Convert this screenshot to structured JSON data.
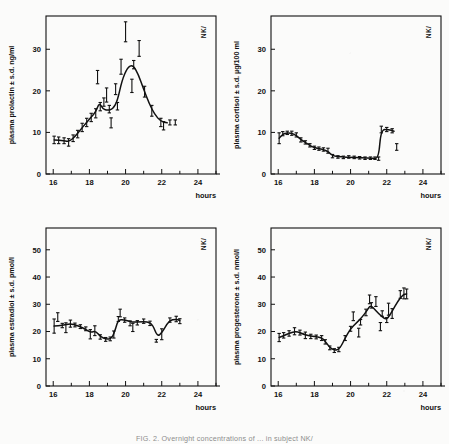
{
  "figure": {
    "subject_label": "NK/",
    "caption": "FIG. 2. Overnight concentrations of ... in subject NK/",
    "xlabel": "hours",
    "x_ticks_major": [
      "16",
      "18",
      "20",
      "22",
      "24"
    ],
    "x_range": [
      15.6,
      25.0
    ],
    "ink_color": "#111111"
  },
  "chart_data": [
    {
      "id": "prolactin",
      "type": "line",
      "title": "",
      "ylabel": "plasma prolactin ± s.d. ng/ml",
      "xlabel": "hours",
      "subject": "NK/",
      "ylim": [
        0,
        38
      ],
      "y_ticks": [
        "0",
        "10",
        "20",
        "30"
      ],
      "xlim": [
        15.6,
        25.0
      ],
      "x_ticks": [
        "16",
        "18",
        "20",
        "22",
        "24"
      ],
      "grid": false,
      "legend": "none",
      "points": [
        {
          "x": 16.05,
          "y": 8.2,
          "sd": 0.9
        },
        {
          "x": 16.3,
          "y": 8.1,
          "sd": 0.8
        },
        {
          "x": 16.6,
          "y": 8.0,
          "sd": 0.7
        },
        {
          "x": 16.85,
          "y": 7.6,
          "sd": 0.9
        },
        {
          "x": 17.1,
          "y": 8.6,
          "sd": 0.8
        },
        {
          "x": 17.35,
          "y": 9.6,
          "sd": 0.9
        },
        {
          "x": 17.6,
          "y": 11.2,
          "sd": 1.0
        },
        {
          "x": 17.85,
          "y": 12.4,
          "sd": 1.0
        },
        {
          "x": 18.1,
          "y": 13.6,
          "sd": 1.0
        },
        {
          "x": 18.35,
          "y": 14.6,
          "sd": 1.1
        },
        {
          "x": 18.45,
          "y": 23.3,
          "sd": 1.6
        },
        {
          "x": 18.6,
          "y": 16.2,
          "sd": 1.0
        },
        {
          "x": 18.8,
          "y": 17.3,
          "sd": 1.0
        },
        {
          "x": 18.95,
          "y": 19.0,
          "sd": 1.7
        },
        {
          "x": 19.1,
          "y": 15.6,
          "sd": 0.9
        },
        {
          "x": 19.2,
          "y": 12.3,
          "sd": 1.2
        },
        {
          "x": 19.45,
          "y": 20.4,
          "sd": 1.3
        },
        {
          "x": 19.55,
          "y": 16.3,
          "sd": 0.9
        },
        {
          "x": 19.75,
          "y": 25.8,
          "sd": 1.8
        },
        {
          "x": 20.0,
          "y": 34.2,
          "sd": 2.4
        },
        {
          "x": 20.35,
          "y": 21.2,
          "sd": 1.6
        },
        {
          "x": 20.45,
          "y": 26.3,
          "sd": 1.0
        },
        {
          "x": 20.75,
          "y": 30.2,
          "sd": 1.9
        },
        {
          "x": 21.05,
          "y": 19.8,
          "sd": 1.3
        },
        {
          "x": 21.45,
          "y": 15.2,
          "sd": 1.3
        },
        {
          "x": 21.95,
          "y": 12.4,
          "sd": 1.0
        },
        {
          "x": 22.1,
          "y": 11.6,
          "sd": 1.0
        },
        {
          "x": 22.45,
          "y": 12.4,
          "sd": 0.6
        },
        {
          "x": 22.75,
          "y": 12.4,
          "sd": 0.6
        }
      ],
      "curve": [
        {
          "x": 16.05,
          "y": 8.2
        },
        {
          "x": 16.6,
          "y": 8.0
        },
        {
          "x": 16.9,
          "y": 7.8
        },
        {
          "x": 17.2,
          "y": 9.0
        },
        {
          "x": 17.5,
          "y": 10.6
        },
        {
          "x": 17.8,
          "y": 12.2
        },
        {
          "x": 18.1,
          "y": 13.7
        },
        {
          "x": 18.35,
          "y": 14.9
        },
        {
          "x": 18.55,
          "y": 17.2
        },
        {
          "x": 18.75,
          "y": 15.6
        },
        {
          "x": 19.0,
          "y": 15.3
        },
        {
          "x": 19.3,
          "y": 15.6
        },
        {
          "x": 19.55,
          "y": 17.6
        },
        {
          "x": 19.8,
          "y": 22.5
        },
        {
          "x": 20.1,
          "y": 25.6
        },
        {
          "x": 20.4,
          "y": 26.3
        },
        {
          "x": 20.7,
          "y": 24.0
        },
        {
          "x": 21.0,
          "y": 20.4
        },
        {
          "x": 21.3,
          "y": 17.0
        },
        {
          "x": 21.6,
          "y": 14.4
        },
        {
          "x": 21.95,
          "y": 12.6
        },
        {
          "x": 22.3,
          "y": 12.3
        }
      ]
    },
    {
      "id": "cortisol",
      "type": "line",
      "title": "",
      "ylabel": "plasma cortisol ± s.d. µg/100 ml",
      "xlabel": "hours",
      "subject": "NK/",
      "ylim": [
        0,
        38
      ],
      "y_ticks": [
        "0",
        "10",
        "20",
        "30"
      ],
      "xlim": [
        15.6,
        25.0
      ],
      "x_ticks": [
        "16",
        "18",
        "20",
        "22",
        "24"
      ],
      "grid": false,
      "legend": "none",
      "points": [
        {
          "x": 16.05,
          "y": 8.6,
          "sd": 1.3
        },
        {
          "x": 16.25,
          "y": 9.7,
          "sd": 0.5
        },
        {
          "x": 16.5,
          "y": 9.9,
          "sd": 0.4
        },
        {
          "x": 16.75,
          "y": 9.8,
          "sd": 0.5
        },
        {
          "x": 17.0,
          "y": 9.4,
          "sd": 0.5
        },
        {
          "x": 17.25,
          "y": 8.2,
          "sd": 0.5
        },
        {
          "x": 17.5,
          "y": 7.6,
          "sd": 0.4
        },
        {
          "x": 17.75,
          "y": 6.9,
          "sd": 0.4
        },
        {
          "x": 18.0,
          "y": 6.3,
          "sd": 0.4
        },
        {
          "x": 18.25,
          "y": 6.1,
          "sd": 0.4
        },
        {
          "x": 18.5,
          "y": 5.9,
          "sd": 0.4
        },
        {
          "x": 18.75,
          "y": 5.6,
          "sd": 0.6
        },
        {
          "x": 19.0,
          "y": 4.3,
          "sd": 0.4
        },
        {
          "x": 19.3,
          "y": 4.1,
          "sd": 0.3
        },
        {
          "x": 19.6,
          "y": 4.0,
          "sd": 0.3
        },
        {
          "x": 19.9,
          "y": 4.1,
          "sd": 0.3
        },
        {
          "x": 20.2,
          "y": 4.0,
          "sd": 0.3
        },
        {
          "x": 20.5,
          "y": 3.9,
          "sd": 0.3
        },
        {
          "x": 20.8,
          "y": 3.8,
          "sd": 0.3
        },
        {
          "x": 21.1,
          "y": 3.8,
          "sd": 0.3
        },
        {
          "x": 21.35,
          "y": 3.8,
          "sd": 0.3
        },
        {
          "x": 21.55,
          "y": 3.7,
          "sd": 0.4
        },
        {
          "x": 21.7,
          "y": 10.7,
          "sd": 0.8
        },
        {
          "x": 22.0,
          "y": 10.7,
          "sd": 0.5
        },
        {
          "x": 22.3,
          "y": 10.4,
          "sd": 0.5
        },
        {
          "x": 22.55,
          "y": 6.5,
          "sd": 0.8
        }
      ],
      "curve": [
        {
          "x": 16.05,
          "y": 8.6
        },
        {
          "x": 16.3,
          "y": 9.8
        },
        {
          "x": 16.7,
          "y": 9.9
        },
        {
          "x": 17.0,
          "y": 9.3
        },
        {
          "x": 17.3,
          "y": 8.1
        },
        {
          "x": 17.6,
          "y": 7.3
        },
        {
          "x": 17.9,
          "y": 6.5
        },
        {
          "x": 18.2,
          "y": 6.1
        },
        {
          "x": 18.5,
          "y": 5.9
        },
        {
          "x": 18.8,
          "y": 5.3
        },
        {
          "x": 19.0,
          "y": 4.3
        },
        {
          "x": 19.5,
          "y": 4.1
        },
        {
          "x": 20.0,
          "y": 4.0
        },
        {
          "x": 20.6,
          "y": 3.9
        },
        {
          "x": 21.2,
          "y": 3.8
        },
        {
          "x": 21.55,
          "y": 3.7
        },
        {
          "x": 21.68,
          "y": 10.7
        },
        {
          "x": 22.1,
          "y": 10.7
        },
        {
          "x": 22.4,
          "y": 10.3
        }
      ]
    },
    {
      "id": "estradiol",
      "type": "line",
      "title": "",
      "ylabel": "plasma estradiol ± s.d. pmol/l",
      "xlabel": "hours",
      "subject": "NK/",
      "ylim": [
        0,
        58
      ],
      "y_ticks": [
        "0",
        "10",
        "20",
        "30",
        "40",
        "50"
      ],
      "xlim": [
        15.6,
        25.0
      ],
      "x_ticks": [
        "16",
        "18",
        "20",
        "22",
        "24"
      ],
      "grid": false,
      "legend": "none",
      "points": [
        {
          "x": 16.05,
          "y": 22.0,
          "sd": 2.6
        },
        {
          "x": 16.25,
          "y": 25.3,
          "sd": 1.6
        },
        {
          "x": 16.5,
          "y": 22.2,
          "sd": 0.8
        },
        {
          "x": 16.7,
          "y": 21.4,
          "sd": 1.8
        },
        {
          "x": 16.95,
          "y": 22.9,
          "sd": 1.3
        },
        {
          "x": 17.2,
          "y": 22.4,
          "sd": 0.7
        },
        {
          "x": 17.5,
          "y": 21.8,
          "sd": 0.7
        },
        {
          "x": 17.8,
          "y": 21.0,
          "sd": 0.7
        },
        {
          "x": 18.05,
          "y": 19.0,
          "sd": 1.7
        },
        {
          "x": 18.3,
          "y": 20.3,
          "sd": 1.8
        },
        {
          "x": 18.6,
          "y": 18.0,
          "sd": 0.8
        },
        {
          "x": 18.9,
          "y": 17.1,
          "sd": 0.7
        },
        {
          "x": 19.15,
          "y": 17.3,
          "sd": 0.7
        },
        {
          "x": 19.35,
          "y": 18.9,
          "sd": 1.3
        },
        {
          "x": 19.6,
          "y": 24.6,
          "sd": 0.9
        },
        {
          "x": 19.7,
          "y": 26.8,
          "sd": 1.4
        },
        {
          "x": 19.95,
          "y": 24.2,
          "sd": 0.8
        },
        {
          "x": 20.25,
          "y": 23.0,
          "sd": 0.9
        },
        {
          "x": 20.4,
          "y": 21.5,
          "sd": 1.5
        },
        {
          "x": 20.65,
          "y": 23.2,
          "sd": 0.8
        },
        {
          "x": 21.0,
          "y": 23.8,
          "sd": 0.8
        },
        {
          "x": 21.35,
          "y": 23.0,
          "sd": 0.8
        },
        {
          "x": 21.7,
          "y": 16.6,
          "sd": 0.5
        },
        {
          "x": 22.0,
          "y": 19.0,
          "sd": 2.0
        },
        {
          "x": 22.45,
          "y": 24.2,
          "sd": 0.8
        },
        {
          "x": 22.8,
          "y": 24.6,
          "sd": 1.0
        },
        {
          "x": 23.0,
          "y": 23.8,
          "sd": 0.9
        }
      ],
      "curve": [
        {
          "x": 16.05,
          "y": 22.0
        },
        {
          "x": 16.5,
          "y": 22.3
        },
        {
          "x": 16.95,
          "y": 22.9
        },
        {
          "x": 17.3,
          "y": 22.3
        },
        {
          "x": 17.7,
          "y": 21.2
        },
        {
          "x": 18.05,
          "y": 19.6
        },
        {
          "x": 18.35,
          "y": 20.2
        },
        {
          "x": 18.6,
          "y": 18.1
        },
        {
          "x": 18.95,
          "y": 17.1
        },
        {
          "x": 19.25,
          "y": 17.5
        },
        {
          "x": 19.45,
          "y": 21.0
        },
        {
          "x": 19.6,
          "y": 24.5
        },
        {
          "x": 20.0,
          "y": 24.2
        },
        {
          "x": 20.4,
          "y": 23.4
        },
        {
          "x": 20.8,
          "y": 23.6
        },
        {
          "x": 21.2,
          "y": 23.6
        },
        {
          "x": 21.5,
          "y": 22.6
        },
        {
          "x": 21.75,
          "y": 18.2
        },
        {
          "x": 22.0,
          "y": 19.4
        },
        {
          "x": 22.4,
          "y": 24.0
        },
        {
          "x": 22.8,
          "y": 24.6
        },
        {
          "x": 23.0,
          "y": 24.0
        }
      ]
    },
    {
      "id": "progesterone",
      "type": "line",
      "title": "",
      "ylabel": "plasma progesterone ± s.d. nmol/l",
      "xlabel": "hours",
      "subject": "NK/",
      "ylim": [
        0,
        58
      ],
      "y_ticks": [
        "0",
        "10",
        "20",
        "30",
        "40",
        "50"
      ],
      "xlim": [
        15.6,
        25.0
      ],
      "x_ticks": [
        "16",
        "18",
        "20",
        "22",
        "24"
      ],
      "grid": false,
      "legend": "none",
      "points": [
        {
          "x": 16.05,
          "y": 17.8,
          "sd": 1.5
        },
        {
          "x": 16.3,
          "y": 18.6,
          "sd": 1.0
        },
        {
          "x": 16.6,
          "y": 19.3,
          "sd": 1.0
        },
        {
          "x": 16.9,
          "y": 20.1,
          "sd": 1.3
        },
        {
          "x": 17.2,
          "y": 19.6,
          "sd": 0.9
        },
        {
          "x": 17.5,
          "y": 18.6,
          "sd": 1.2
        },
        {
          "x": 17.8,
          "y": 18.2,
          "sd": 0.8
        },
        {
          "x": 18.1,
          "y": 18.0,
          "sd": 0.7
        },
        {
          "x": 18.4,
          "y": 17.6,
          "sd": 0.9
        },
        {
          "x": 18.6,
          "y": 16.2,
          "sd": 0.8
        },
        {
          "x": 18.85,
          "y": 14.0,
          "sd": 0.7
        },
        {
          "x": 19.1,
          "y": 13.0,
          "sd": 0.7
        },
        {
          "x": 19.35,
          "y": 13.4,
          "sd": 0.8
        },
        {
          "x": 19.7,
          "y": 17.6,
          "sd": 0.9
        },
        {
          "x": 20.0,
          "y": 21.0,
          "sd": 0.9
        },
        {
          "x": 20.15,
          "y": 25.6,
          "sd": 1.6
        },
        {
          "x": 20.45,
          "y": 19.6,
          "sd": 1.6
        },
        {
          "x": 20.55,
          "y": 23.4,
          "sd": 1.0
        },
        {
          "x": 20.85,
          "y": 27.0,
          "sd": 1.2
        },
        {
          "x": 21.05,
          "y": 31.8,
          "sd": 1.6
        },
        {
          "x": 21.15,
          "y": 29.6,
          "sd": 1.0
        },
        {
          "x": 21.4,
          "y": 31.0,
          "sd": 1.8
        },
        {
          "x": 21.65,
          "y": 21.8,
          "sd": 1.5
        },
        {
          "x": 21.75,
          "y": 26.6,
          "sd": 1.0
        },
        {
          "x": 22.0,
          "y": 24.2,
          "sd": 0.9
        },
        {
          "x": 22.1,
          "y": 28.2,
          "sd": 2.2
        },
        {
          "x": 22.3,
          "y": 26.6,
          "sd": 1.8
        },
        {
          "x": 22.75,
          "y": 33.6,
          "sd": 1.4
        },
        {
          "x": 22.95,
          "y": 34.0,
          "sd": 2.0
        },
        {
          "x": 23.1,
          "y": 33.8,
          "sd": 1.8
        }
      ],
      "curve": [
        {
          "x": 16.05,
          "y": 17.8
        },
        {
          "x": 16.6,
          "y": 19.3
        },
        {
          "x": 17.0,
          "y": 20.1
        },
        {
          "x": 17.4,
          "y": 19.0
        },
        {
          "x": 17.8,
          "y": 18.3
        },
        {
          "x": 18.2,
          "y": 18.0
        },
        {
          "x": 18.5,
          "y": 17.4
        },
        {
          "x": 18.8,
          "y": 14.4
        },
        {
          "x": 19.1,
          "y": 13.0
        },
        {
          "x": 19.4,
          "y": 13.6
        },
        {
          "x": 19.7,
          "y": 17.6
        },
        {
          "x": 20.0,
          "y": 21.0
        },
        {
          "x": 20.3,
          "y": 23.0
        },
        {
          "x": 20.6,
          "y": 25.0
        },
        {
          "x": 20.9,
          "y": 27.6
        },
        {
          "x": 21.1,
          "y": 29.8
        },
        {
          "x": 21.4,
          "y": 27.6
        },
        {
          "x": 21.7,
          "y": 25.6
        },
        {
          "x": 22.0,
          "y": 24.2
        },
        {
          "x": 22.3,
          "y": 27.4
        },
        {
          "x": 22.6,
          "y": 31.0
        },
        {
          "x": 22.9,
          "y": 33.6
        },
        {
          "x": 23.1,
          "y": 33.8
        }
      ]
    }
  ]
}
